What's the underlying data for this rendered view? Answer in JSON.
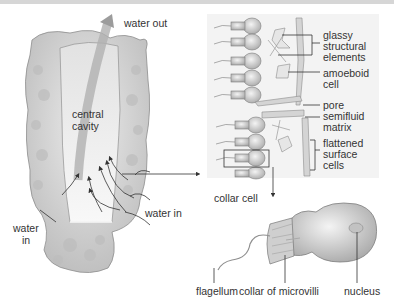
{
  "diagram": {
    "sponge_labels": {
      "water_out": "water out",
      "central_cavity_line1": "central",
      "central_cavity_line2": "cavity",
      "water_in_right": "water in",
      "water_in_left_line1": "water",
      "water_in_left_line2": "in"
    },
    "wall_detail_labels": {
      "glassy_line1": "glassy",
      "glassy_line2": "structural",
      "glassy_line3": "elements",
      "amoeboid_line1": "amoeboid",
      "amoeboid_line2": "cell",
      "pore": "pore",
      "semifluid_line1": "semifluid",
      "semifluid_line2": "matrix",
      "flattened_line1": "flattened",
      "flattened_line2": "surface",
      "flattened_line3": "cells"
    },
    "collar_cell_labels": {
      "title": "collar cell",
      "flagellum": "flagellum",
      "collar": "collar of microvilli",
      "nucleus": "nucleus"
    },
    "colors": {
      "sponge_body": "#d9d9d9",
      "sponge_shadow": "#a8a8a8",
      "cavity": "#f4f4f4",
      "inset_bg": "#f3f3f3",
      "label_text": "#333333",
      "leader_line": "#333333"
    }
  }
}
